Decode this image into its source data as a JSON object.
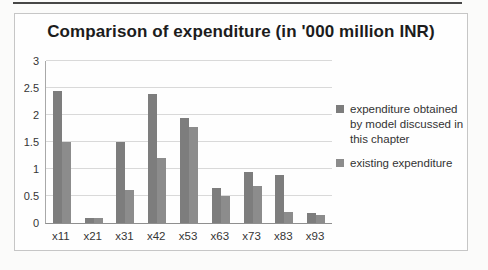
{
  "figure": {
    "top_rule_color": "#474747",
    "frame_border_color": "#c6c6c6",
    "background_color": "#fefefe"
  },
  "chart_data": {
    "type": "bar",
    "title": "Comparison of expenditure (in '000 million INR)",
    "categories": [
      "x11",
      "x21",
      "x31",
      "x42",
      "x53",
      "x63",
      "x73",
      "x83",
      "x93"
    ],
    "series": [
      {
        "name": "expenditure obtained by model discussed in this chapter",
        "color": "#7d7d7d",
        "values": [
          2.45,
          0.1,
          1.5,
          2.38,
          1.95,
          0.65,
          0.95,
          0.88,
          0.18
        ]
      },
      {
        "name": "existing expenditure",
        "color": "#8c8c8c",
        "values": [
          1.5,
          0.1,
          0.62,
          1.2,
          1.77,
          0.5,
          0.68,
          0.2,
          0.14
        ]
      }
    ],
    "xlabel": "",
    "ylabel": "",
    "ylim": [
      0,
      3
    ],
    "yticks": [
      0,
      0.5,
      1,
      1.5,
      2,
      2.5,
      3
    ],
    "grid": true,
    "legend_position": "right"
  }
}
